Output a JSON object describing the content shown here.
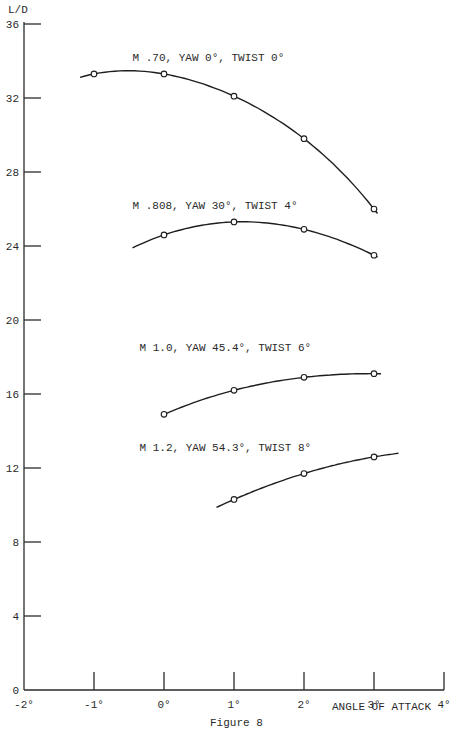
{
  "chart_data": {
    "type": "line",
    "title": "Figure 8",
    "xlabel": "ANGLE OF ATTACK",
    "ylabel": "L/D",
    "xlim": [
      -2,
      4
    ],
    "ylim": [
      0,
      36
    ],
    "grid": false,
    "x_ticks": [
      -2,
      -1,
      0,
      1,
      2,
      3,
      4
    ],
    "x_tick_labels": [
      "-2°",
      "-1°",
      "0°",
      "1°",
      "2°",
      "3°",
      "4°"
    ],
    "y_ticks": [
      0,
      4,
      8,
      12,
      16,
      20,
      24,
      28,
      32,
      36
    ],
    "y_tick_labels": [
      "0",
      "4",
      "8",
      "12",
      "16",
      "20",
      "24",
      "28",
      "32",
      "36"
    ],
    "series": [
      {
        "name": "M .70, YAW 0°, TWIST 0°",
        "x": [
          -1,
          0,
          1,
          2,
          3
        ],
        "values": [
          33.3,
          33.3,
          32.1,
          29.8,
          26.0
        ],
        "curve_range": [
          -1.2,
          3.05
        ],
        "label_pos": [
          -0.45,
          34.0
        ]
      },
      {
        "name": "M .808, YAW 30°, TWIST 4°",
        "x": [
          0,
          1,
          2,
          3
        ],
        "values": [
          24.6,
          25.3,
          24.9,
          23.5
        ],
        "curve_range": [
          -0.45,
          3.05
        ],
        "label_pos": [
          -0.45,
          26.0
        ]
      },
      {
        "name": "M 1.0, YAW 45.4°, TWIST 6°",
        "x": [
          0,
          1,
          2,
          3
        ],
        "values": [
          14.9,
          16.2,
          16.9,
          17.1
        ],
        "curve_range": [
          0,
          3.1
        ],
        "label_pos": [
          -0.35,
          18.3
        ]
      },
      {
        "name": "M 1.2, YAW 54.3°, TWIST 8°",
        "x": [
          1,
          2,
          3
        ],
        "values": [
          10.3,
          11.7,
          12.6
        ],
        "curve_range": [
          0.75,
          3.35
        ],
        "label_pos": [
          -0.35,
          12.9
        ]
      }
    ]
  },
  "labels": {
    "y_axis_title": "L/D",
    "x_axis_title": "ANGLE OF ATTACK",
    "figure_caption": "Figure 8"
  }
}
